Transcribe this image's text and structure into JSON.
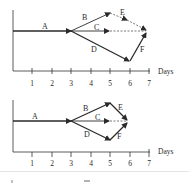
{
  "diagrams": [
    {
      "id": "top",
      "x_axis_label": "Days",
      "ticks": [
        "1",
        "2",
        "3",
        "4",
        "5",
        "6",
        "7"
      ],
      "activities": [
        {
          "label": "A",
          "from_day": 0,
          "to_day": 3,
          "style": "solid-bold"
        },
        {
          "label": "B",
          "from_day": 3,
          "to_day": 5,
          "style": "solid"
        },
        {
          "label": "C",
          "from_day": 3,
          "to_day": 5,
          "style": "solid",
          "slack_to_day": 7
        },
        {
          "label": "D",
          "from_day": 3,
          "to_day": 6,
          "style": "bold"
        },
        {
          "label": "E",
          "from_day": 5,
          "to_day": 7,
          "style": "dashed"
        },
        {
          "label": "F",
          "from_day": 6,
          "to_day": 7,
          "style": "bold"
        }
      ]
    },
    {
      "id": "bottom",
      "x_axis_label": "Days",
      "ticks": [
        "1",
        "2",
        "3",
        "4",
        "5",
        "6",
        "7"
      ],
      "activities": [
        {
          "label": "A",
          "from_day": 0,
          "to_day": 3,
          "style": "solid-bold"
        },
        {
          "label": "B",
          "from_day": 3,
          "to_day": 5,
          "style": "solid-bold"
        },
        {
          "label": "C",
          "from_day": 3,
          "to_day": 5,
          "style": "solid",
          "slack_to_day": 6
        },
        {
          "label": "D",
          "from_day": 3,
          "to_day": 5,
          "style": "solid-bold"
        },
        {
          "label": "E",
          "from_day": 5,
          "to_day": 6,
          "style": "solid-bold"
        },
        {
          "label": "F",
          "from_day": 5,
          "to_day": 6,
          "style": "solid-bold"
        }
      ]
    }
  ]
}
